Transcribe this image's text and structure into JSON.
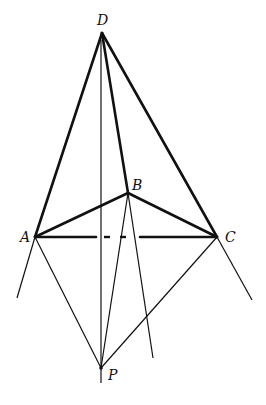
{
  "diagram": {
    "type": "geometric-figure",
    "colors": {
      "stroke": "#111111",
      "background": "#ffffff"
    },
    "points": {
      "D": {
        "label": "D",
        "x": 102,
        "y": 33
      },
      "A": {
        "label": "A",
        "x": 35,
        "y": 237
      },
      "B": {
        "label": "B",
        "x": 128,
        "y": 193
      },
      "C": {
        "label": "C",
        "x": 217,
        "y": 237
      },
      "P": {
        "label": "P",
        "x": 101,
        "y": 368
      }
    },
    "labels": {
      "D": "D",
      "A": "A",
      "B": "B",
      "C": "C",
      "P": "P"
    },
    "edges": [
      {
        "from": "D",
        "to": "A",
        "style": "thick"
      },
      {
        "from": "D",
        "to": "C",
        "style": "thick"
      },
      {
        "from": "D",
        "to": "B",
        "style": "thick"
      },
      {
        "from": "A",
        "to": "B",
        "style": "thick"
      },
      {
        "from": "B",
        "to": "C",
        "style": "thick"
      },
      {
        "from": "A",
        "to": "C",
        "style": "thick-dashed-middle"
      },
      {
        "from": "A",
        "to": "P",
        "style": "thin"
      },
      {
        "from": "C",
        "to": "P",
        "style": "thin"
      },
      {
        "from": "B",
        "to": "P",
        "style": "thin"
      },
      {
        "from": "D",
        "to": "P",
        "style": "thin-vertical"
      }
    ]
  }
}
